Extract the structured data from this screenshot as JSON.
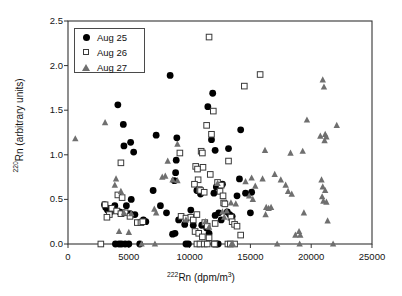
{
  "chart_data": {
    "type": "scatter",
    "title": "",
    "xlabel": "222Rn (dpm/m3)",
    "ylabel": "220Rn (arbitrary units)",
    "xlim": [
      0,
      25000
    ],
    "ylim": [
      0.0,
      2.5
    ],
    "xticks": [
      0,
      5000,
      10000,
      15000,
      20000,
      25000
    ],
    "yticks": [
      0.0,
      0.5,
      1.0,
      1.5,
      2.0,
      2.5
    ],
    "xtick_labels": [
      "0",
      "5000",
      "10000",
      "15000",
      "20000",
      "25000"
    ],
    "ytick_labels": [
      "0.0",
      "0.5",
      "1.0",
      "1.5",
      "2.0",
      "2.5"
    ],
    "grid": false,
    "legend_position": "upper-left",
    "series": [
      {
        "name": "Aug 25",
        "marker": "filled-circle",
        "color": "#000000",
        "points": [
          [
            4100,
            1.56
          ],
          [
            4550,
            1.34
          ],
          [
            4600,
            1.1
          ],
          [
            5150,
            1.14
          ],
          [
            5400,
            1.03
          ],
          [
            7250,
            1.22
          ],
          [
            8400,
            1.89
          ],
          [
            8950,
            1.19
          ],
          [
            8900,
            0.94
          ],
          [
            8850,
            0.8
          ],
          [
            8750,
            0.71
          ],
          [
            11900,
            1.69
          ],
          [
            11500,
            1.54
          ],
          [
            11800,
            1.17
          ],
          [
            12100,
            1.05
          ],
          [
            13200,
            1.07
          ],
          [
            14200,
            1.28
          ],
          [
            14100,
            0.73
          ],
          [
            5200,
            0.5
          ],
          [
            7000,
            0.6
          ],
          [
            3000,
            0.44
          ],
          [
            3100,
            0.41
          ],
          [
            3250,
            0.38
          ],
          [
            3400,
            0.4
          ],
          [
            3500,
            0.36
          ],
          [
            3700,
            0.39
          ],
          [
            3850,
            0.43
          ],
          [
            4250,
            0.36
          ],
          [
            4600,
            0.35
          ],
          [
            4800,
            0.43
          ],
          [
            5100,
            0.34
          ],
          [
            5500,
            0.33
          ],
          [
            6200,
            0.27
          ],
          [
            6400,
            0.25
          ],
          [
            7600,
            0.43
          ],
          [
            8100,
            0.35
          ],
          [
            8600,
            0.11
          ],
          [
            8800,
            0.12
          ],
          [
            9100,
            0.27
          ],
          [
            9600,
            0.22
          ],
          [
            10300,
            0.21
          ],
          [
            10600,
            0.6
          ],
          [
            10900,
            0.56
          ],
          [
            11000,
            0.21
          ],
          [
            11400,
            0.18
          ],
          [
            11600,
            0.12
          ],
          [
            12100,
            0.32
          ],
          [
            12400,
            0.35
          ],
          [
            12600,
            0.27
          ],
          [
            13100,
            0.36
          ],
          [
            13300,
            0.33
          ],
          [
            13500,
            0.31
          ],
          [
            13900,
            0.54
          ],
          [
            14600,
            0.57
          ],
          [
            15100,
            0.58
          ],
          [
            15000,
            0.35
          ],
          [
            10100,
            0.38
          ],
          [
            12000,
            0.57
          ],
          [
            12200,
            0.64
          ],
          [
            12700,
            0.67
          ],
          [
            3900,
            0.0
          ],
          [
            4200,
            0.0
          ],
          [
            4400,
            0.0
          ],
          [
            4700,
            0.0
          ],
          [
            5000,
            0.0
          ],
          [
            5900,
            0.0
          ],
          [
            9700,
            0.0
          ],
          [
            9900,
            0.0
          ],
          [
            12000,
            0.0
          ],
          [
            12200,
            0.0
          ],
          [
            12350,
            0.0
          ]
        ]
      },
      {
        "name": "Aug 26",
        "marker": "open-square",
        "color": "#3a3a3a",
        "points": [
          [
            11600,
            2.32
          ],
          [
            15800,
            1.9
          ],
          [
            14500,
            1.77
          ],
          [
            11950,
            1.49
          ],
          [
            11400,
            1.33
          ],
          [
            11800,
            1.23
          ],
          [
            10950,
            1.04
          ],
          [
            11050,
            1.02
          ],
          [
            9200,
            1.02
          ],
          [
            4350,
            0.91
          ],
          [
            10500,
            0.87
          ],
          [
            11100,
            0.86
          ],
          [
            10650,
            0.84
          ],
          [
            11700,
            0.78
          ],
          [
            13200,
            0.93
          ],
          [
            10700,
            0.72
          ],
          [
            10400,
            0.67
          ],
          [
            12300,
            0.69
          ],
          [
            12600,
            0.66
          ],
          [
            10800,
            0.61
          ],
          [
            10900,
            0.6
          ],
          [
            11200,
            0.58
          ],
          [
            12500,
            0.59
          ],
          [
            12750,
            0.54
          ],
          [
            4100,
            0.55
          ],
          [
            12800,
            0.46
          ],
          [
            12900,
            0.45
          ],
          [
            4450,
            0.52
          ],
          [
            3050,
            0.44
          ],
          [
            3600,
            0.4
          ],
          [
            3400,
            0.33
          ],
          [
            3200,
            0.3
          ],
          [
            4000,
            0.37
          ],
          [
            4350,
            0.34
          ],
          [
            4700,
            0.35
          ],
          [
            5100,
            0.31
          ],
          [
            5700,
            0.24
          ],
          [
            6000,
            0.24
          ],
          [
            6150,
            0.25
          ],
          [
            9300,
            0.31
          ],
          [
            9700,
            0.29
          ],
          [
            10100,
            0.3
          ],
          [
            10300,
            0.27
          ],
          [
            10600,
            0.33
          ],
          [
            11250,
            0.24
          ],
          [
            11450,
            0.2
          ],
          [
            10450,
            0.14
          ],
          [
            10750,
            0.12
          ],
          [
            11050,
            0.08
          ],
          [
            11600,
            0.07
          ],
          [
            13400,
            0.3
          ],
          [
            13500,
            0.25
          ],
          [
            13700,
            0.22
          ],
          [
            13900,
            0.2
          ],
          [
            14200,
            0.1
          ],
          [
            12100,
            0.23
          ],
          [
            2700,
            0.0
          ],
          [
            10600,
            0.0
          ],
          [
            10850,
            0.0
          ],
          [
            11200,
            0.0
          ],
          [
            11450,
            0.0
          ],
          [
            12050,
            0.0
          ],
          [
            13150,
            0.0
          ],
          [
            13350,
            0.0
          ],
          [
            13700,
            0.0
          ]
        ]
      },
      {
        "name": "Aug 27",
        "marker": "filled-triangle",
        "color": "#6f6f6f",
        "points": [
          [
            600,
            1.18
          ],
          [
            3050,
            1.36
          ],
          [
            8200,
            0.93
          ],
          [
            9000,
            1.12
          ],
          [
            20950,
            1.84
          ],
          [
            21050,
            1.76
          ],
          [
            19650,
            1.39
          ],
          [
            22100,
            1.33
          ],
          [
            20750,
            1.21
          ],
          [
            21150,
            1.23
          ],
          [
            21250,
            1.2
          ],
          [
            21100,
            1.16
          ],
          [
            16200,
            1.05
          ],
          [
            18300,
            1.02
          ],
          [
            19300,
            1.04
          ],
          [
            3950,
            0.73
          ],
          [
            3850,
            0.66
          ],
          [
            4350,
            0.59
          ],
          [
            4600,
            0.35
          ],
          [
            7750,
            0.75
          ],
          [
            8000,
            0.76
          ],
          [
            8600,
            0.72
          ],
          [
            9000,
            0.71
          ],
          [
            12300,
            0.68
          ],
          [
            14600,
            0.7
          ],
          [
            15100,
            0.74
          ],
          [
            15400,
            0.65
          ],
          [
            16000,
            0.73
          ],
          [
            17000,
            0.78
          ],
          [
            17500,
            0.72
          ],
          [
            17900,
            0.66
          ],
          [
            18100,
            0.59
          ],
          [
            18400,
            0.56
          ],
          [
            20850,
            0.72
          ],
          [
            20950,
            0.64
          ],
          [
            21150,
            0.6
          ],
          [
            20900,
            0.53
          ],
          [
            21000,
            0.48
          ],
          [
            21250,
            0.47
          ],
          [
            13800,
            0.45
          ],
          [
            14900,
            0.54
          ],
          [
            15200,
            0.5
          ],
          [
            16300,
            0.41
          ],
          [
            16500,
            0.4
          ],
          [
            16700,
            0.41
          ],
          [
            16250,
            0.33
          ],
          [
            19400,
            0.35
          ],
          [
            21350,
            0.26
          ],
          [
            7100,
            0.39
          ],
          [
            7250,
            0.35
          ],
          [
            5200,
            0.34
          ],
          [
            9700,
            0.27
          ],
          [
            11300,
            0.25
          ],
          [
            12700,
            0.36
          ],
          [
            13050,
            0.37
          ],
          [
            12850,
            0.3
          ],
          [
            13400,
            0.46
          ],
          [
            4200,
            0.14
          ],
          [
            5000,
            0.13
          ],
          [
            11600,
            0.19
          ],
          [
            18700,
            0.1
          ],
          [
            19000,
            0.14
          ],
          [
            19100,
            0.1
          ],
          [
            6050,
            0.0
          ],
          [
            7150,
            0.0
          ],
          [
            13450,
            0.0
          ],
          [
            13550,
            0.0
          ],
          [
            17200,
            0.0
          ],
          [
            19050,
            0.0
          ],
          [
            21800,
            0.0
          ]
        ]
      }
    ]
  },
  "axes": {
    "x_title_prefix": "222",
    "x_title_body": "Rn (dpm/m",
    "x_title_exp": "3",
    "x_title_suffix": ")",
    "y_title_prefix": "220",
    "y_title_body": "Rn (arbitrary units)"
  },
  "legend": {
    "items": [
      {
        "label": "Aug 25",
        "marker": "filled-circle"
      },
      {
        "label": "Aug 26",
        "marker": "open-square"
      },
      {
        "label": "Aug 27",
        "marker": "filled-triangle"
      }
    ]
  }
}
